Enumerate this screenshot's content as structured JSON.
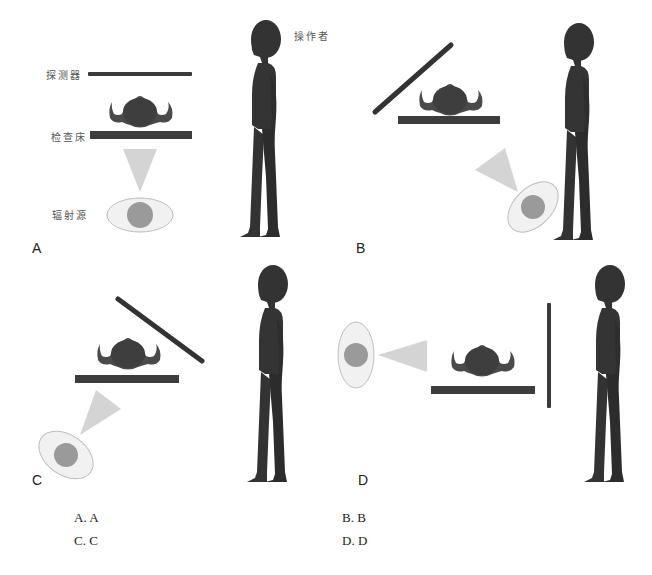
{
  "labels": {
    "detector": "探测器",
    "table": "检查床",
    "source": "辐射源",
    "operator": "操作者"
  },
  "panels": [
    {
      "letter": "A",
      "description": "Detector above patient, source below table pointing up"
    },
    {
      "letter": "B",
      "description": "Detector tilted away from operator, source below-right angled toward patient (near operator)"
    },
    {
      "letter": "C",
      "description": "Detector tilted toward operator, source below-left angled toward patient (away from operator)"
    },
    {
      "letter": "D",
      "description": "Source at far left beam horizontal, vertical detector between patient and operator"
    }
  ],
  "options": [
    {
      "label": "A. A"
    },
    {
      "label": "B. B"
    },
    {
      "label": "C. C"
    },
    {
      "label": "D. D"
    }
  ],
  "colors": {
    "dark": "#3a3a3a",
    "beam": "#d4d4d4",
    "source_fill": "#f1f1f1",
    "source_stroke": "#bdbdbd",
    "source_core": "#9a9a9a"
  }
}
